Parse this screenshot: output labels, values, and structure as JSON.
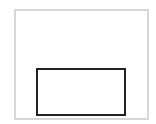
{
  "canvas": {
    "width": 156,
    "height": 124,
    "background": "#ffffff"
  },
  "shapes": [
    {
      "id": "outer-frame",
      "type": "rect",
      "x": 14,
      "y": 9,
      "width": 135,
      "height": 111,
      "stroke": "#d6d6d6",
      "stroke_width": 2
    },
    {
      "id": "inner-box",
      "type": "rect",
      "x": 36,
      "y": 68,
      "width": 90,
      "height": 48,
      "stroke": "#222222",
      "stroke_width": 2
    }
  ]
}
